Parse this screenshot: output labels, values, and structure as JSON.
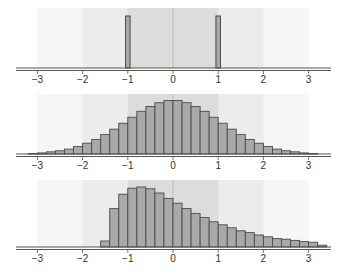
{
  "colors": {
    "bar_fill": "#a9a9a9",
    "bar_stroke": "#4a4a4a",
    "band_inner": "#dcdcdc",
    "band_mid": "#ececec",
    "band_outer": "#f6f6f6",
    "axis": "#555555",
    "zero_line": "#b5b5b5"
  },
  "chart_data": [
    {
      "type": "bar",
      "title": "",
      "xlabel": "",
      "ylabel": "",
      "xlim": [
        -3.5,
        3.5
      ],
      "xticks": [
        -3,
        -2,
        -1,
        0,
        1,
        2,
        3
      ],
      "xtick_labels": [
        "−3",
        "−2",
        "−1",
        "0",
        "1",
        "2",
        "3"
      ],
      "shaded_bands": [
        [
          -3,
          3
        ],
        [
          -2,
          2
        ],
        [
          -1,
          1
        ]
      ],
      "bins": [
        {
          "x0": -1.05,
          "x1": -0.95,
          "height": 1.0
        },
        {
          "x0": 0.95,
          "x1": 1.05,
          "height": 1.0
        }
      ],
      "description": "Two spikes at -1 and +1"
    },
    {
      "type": "bar",
      "title": "",
      "xlabel": "",
      "ylabel": "",
      "xlim": [
        -3.5,
        3.5
      ],
      "xticks": [
        -3,
        -2,
        -1,
        0,
        1,
        2,
        3
      ],
      "xtick_labels": [
        "−3",
        "−2",
        "−1",
        "0",
        "1",
        "2",
        "3"
      ],
      "shaded_bands": [
        [
          -3,
          3
        ],
        [
          -2,
          2
        ],
        [
          -1,
          1
        ]
      ],
      "bin_start": -3.2,
      "bin_width": 0.2,
      "values": [
        0.01,
        0.02,
        0.04,
        0.06,
        0.09,
        0.14,
        0.2,
        0.27,
        0.36,
        0.46,
        0.57,
        0.68,
        0.79,
        0.88,
        0.95,
        0.99,
        0.99,
        0.95,
        0.88,
        0.79,
        0.68,
        0.57,
        0.46,
        0.36,
        0.27,
        0.2,
        0.14,
        0.09,
        0.06,
        0.04,
        0.02,
        0.01
      ],
      "description": "Symmetric bell-shaped (normal) histogram"
    },
    {
      "type": "bar",
      "title": "",
      "xlabel": "",
      "ylabel": "",
      "xlim": [
        -3.5,
        3.5
      ],
      "xticks": [
        -3,
        -2,
        -1,
        0,
        1,
        2,
        3
      ],
      "xtick_labels": [
        "−3",
        "−2",
        "−1",
        "0",
        "1",
        "2",
        "3"
      ],
      "shaded_bands": [
        [
          -3,
          3
        ],
        [
          -2,
          2
        ],
        [
          -1,
          1
        ]
      ],
      "bin_start": -1.6,
      "bin_width": 0.2,
      "values": [
        0.1,
        0.64,
        0.88,
        0.98,
        1.0,
        0.97,
        0.9,
        0.81,
        0.73,
        0.64,
        0.56,
        0.49,
        0.42,
        0.37,
        0.32,
        0.27,
        0.24,
        0.2,
        0.17,
        0.14,
        0.13,
        0.11,
        0.09,
        0.08,
        0.03
      ],
      "description": "Right-skewed histogram starting near -1.6"
    }
  ]
}
